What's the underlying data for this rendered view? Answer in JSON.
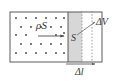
{
  "figure": {
    "type": "physics-diagram",
    "labels": {
      "charge_density_area": "ρS",
      "cross_section": "S",
      "volume_element": "ΔV",
      "length_element": "Δl"
    },
    "colors": {
      "outline": "#4a4a4a",
      "dot": "#3f3f3f",
      "slab_fill": "#d6d6d6",
      "dashed": "#8a8a8a",
      "text": "#3a3a3a",
      "background": "#ffffff"
    },
    "geometry": {
      "box": {
        "x": 10,
        "y": 12,
        "width": 92,
        "height": 50
      },
      "slab": {
        "x": 68,
        "y": 12,
        "width": 14,
        "height": 50
      },
      "dashed_lines_x": [
        82,
        92
      ],
      "drift_arrow": {
        "x1": 38,
        "y1": 36,
        "x2": 64,
        "y2": 36
      },
      "dimension_arrow": {
        "x1": 66,
        "y1": 64,
        "x2": 94,
        "y2": 64
      },
      "leader_line": {
        "x1": 78,
        "y1": 34,
        "x2": 94,
        "y2": 22
      }
    },
    "dot_grid": {
      "rows": 5,
      "columns": 6,
      "stagger": true,
      "radius": 0.9
    }
  }
}
